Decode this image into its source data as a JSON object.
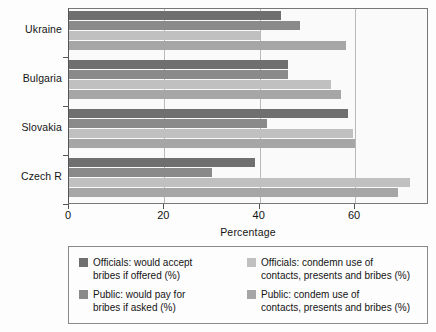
{
  "chart_data": {
    "type": "bar",
    "orientation": "horizontal",
    "title": "",
    "xlabel": "Percentage",
    "ylabel": "",
    "xlim": [
      0,
      75.5
    ],
    "xticks": [
      0,
      20,
      40,
      60
    ],
    "xtick_labels": [
      "0",
      "20",
      "40",
      "60"
    ],
    "grid": true,
    "grid_axis": "x",
    "legend_position": "bottom",
    "categories": [
      "Ukraine",
      "Bulgaria",
      "Slovakia",
      "Czech R"
    ],
    "series": [
      {
        "name": "Officials: would accept bribes if offered (%)",
        "short_name": "officials-accept-bribes",
        "color": "#6f6f6f",
        "values": [
          44.5,
          46.0,
          58.5,
          39.0
        ]
      },
      {
        "name": "Public: would pay for bribes if asked (%)",
        "short_name": "public-pay-bribes",
        "color": "#8a8a8a",
        "values": [
          48.5,
          46.0,
          41.5,
          30.0
        ]
      },
      {
        "name": "Officials: condemn use of contacts, presents and bribes (%)",
        "short_name": "officials-condemn",
        "color": "#c0c0c0",
        "values": [
          40.0,
          55.0,
          59.5,
          71.5
        ]
      },
      {
        "name": "Public: condem use of contacts, presents and bribes (%)",
        "short_name": "public-condemn",
        "color": "#a6a6a6",
        "values": [
          58.0,
          57.0,
          60.0,
          69.0
        ]
      }
    ]
  },
  "legend": {
    "entries": [
      {
        "line1": "Officials: would accept",
        "line2": "bribes if offered (%)",
        "swatch": "s0"
      },
      {
        "line1": "Officials: condemn use of",
        "line2": "contacts, presents and bribes (%)",
        "swatch": "s2"
      },
      {
        "line1": "Public: would pay for",
        "line2": "bribes if asked (%)",
        "swatch": "s1"
      },
      {
        "line1": "Public: condem use of",
        "line2": "contacts, presents and bribes (%)",
        "swatch": "s3"
      }
    ]
  },
  "axis": {
    "x_title": "Percentage",
    "tick_labels": [
      "0",
      "20",
      "40",
      "60"
    ]
  }
}
